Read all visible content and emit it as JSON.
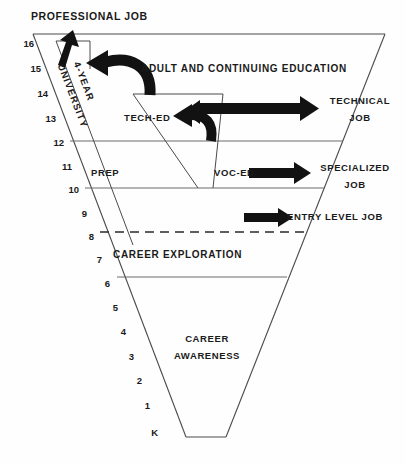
{
  "figure": {
    "type": "funnel-diagram",
    "title_top": "PROFESSIONAL JOB",
    "grade_axis_label": "grade level",
    "grades": [
      "16",
      "15",
      "14",
      "13",
      "12",
      "11",
      "10",
      "9",
      "8",
      "7",
      "6",
      "5",
      "4",
      "3",
      "2",
      "1",
      "K"
    ],
    "bands": [
      {
        "id": "adult-continuing-education",
        "label": "ADULT AND CONTINUING EDUCATION"
      },
      {
        "id": "career-exploration",
        "label": "CAREER EXPLORATION"
      },
      {
        "id": "career-awareness",
        "label": "CAREER\nAWARENESS",
        "line1": "CAREER",
        "line2": "AWARENESS"
      }
    ],
    "programs": [
      {
        "id": "four-year-university",
        "label": "4-YEAR\nUNIVERSITY",
        "line1": "4-YEAR",
        "line2": "UNIVERSITY"
      },
      {
        "id": "tech-ed",
        "label": "TECH-ED"
      },
      {
        "id": "prep",
        "label": "PREP"
      },
      {
        "id": "voc-ed",
        "label": "VOC-ED"
      }
    ],
    "outcomes": [
      {
        "id": "professional-job",
        "label": "PROFESSIONAL JOB"
      },
      {
        "id": "technical-job",
        "line1": "TECHNICAL",
        "line2": "JOB"
      },
      {
        "id": "specialized-job",
        "line1": "SPECIALIZED",
        "line2": "JOB"
      },
      {
        "id": "entry-level-job",
        "label": "ENTRY LEVEL JOB"
      }
    ],
    "colors": {
      "ink": "#1a1a1a",
      "line": "#4a4a4a",
      "arrow": "#121212",
      "background": "#fefefe"
    }
  }
}
